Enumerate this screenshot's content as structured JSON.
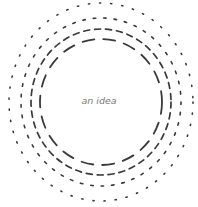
{
  "diagram": {
    "center_label": "an idea",
    "center": {
      "x": 101,
      "y": 102
    },
    "stroke_color": "#3a3a3a",
    "label_color": "#7a7a7a",
    "rings": [
      {
        "name": "ring-outer",
        "rx": 92,
        "ry": 99,
        "dash": "1.2 10",
        "width": 1.6
      },
      {
        "name": "ring-second",
        "rx": 80,
        "ry": 84,
        "dash": "2.5 8",
        "width": 1.6
      },
      {
        "name": "ring-third",
        "rx": 70,
        "ry": 73,
        "dash": "6 5",
        "width": 1.7
      },
      {
        "name": "ring-inner",
        "rx": 61,
        "ry": 63,
        "dash": "12 9",
        "width": 1.8
      }
    ]
  }
}
